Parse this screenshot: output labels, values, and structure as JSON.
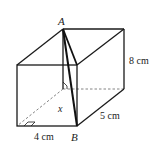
{
  "diagram": {
    "type": "cuboid",
    "colors": {
      "line": "#1a1a1a",
      "hidden": "#666666",
      "background": "#ffffff"
    },
    "labels": {
      "vertex_a": "A",
      "vertex_b": "B",
      "height": "8 cm",
      "depth": "5 cm",
      "width": "4 cm",
      "unknown": "x"
    }
  }
}
